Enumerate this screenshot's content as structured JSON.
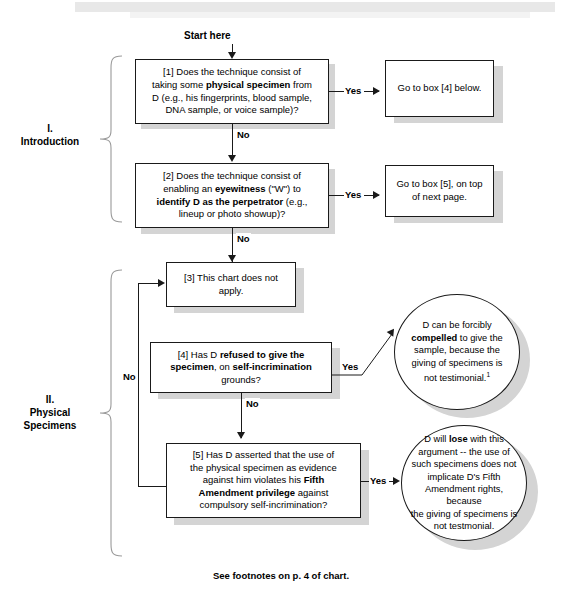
{
  "chart_title": "Self-Incrimination / Physical Specimens Flowchart",
  "start": {
    "label": "Start here"
  },
  "sections": [
    {
      "roman": "I.",
      "name": "Introduction"
    },
    {
      "roman": "II.",
      "name": "Physical",
      "name2": "Specimens"
    }
  ],
  "edge_labels": {
    "yes": "Yes",
    "no": "No"
  },
  "boxes": {
    "b1": {
      "id": "[1]",
      "text_plain": "[1] Does the technique consist of taking some physical specimen from D (e.g., his fingerprints, blood sample, DNA sample, or voice sample)?",
      "line1": "[1] Does the technique consist of",
      "line2a": "taking some ",
      "line2b": "physical specimen",
      "line2c": " from",
      "line3": "D (e.g., his fingerprints, blood sample,",
      "line4": "DNA sample, or voice sample)?"
    },
    "b1_yes": {
      "text_plain": "Go to box [4] below.",
      "line1": "Go to box [4] below."
    },
    "b2": {
      "id": "[2]",
      "text_plain": "[2] Does the technique consist of enabling an eyewitness (\"W\") to identify D as the perpetrator (e.g., lineup or photo showup)?",
      "line1": "[2] Does the technique consist of",
      "line2a": "enabling an ",
      "line2b": "eyewitness",
      "line2c": " (\"W\") to",
      "line3a": "identify D as the perpetrator",
      "line3b": " (e.g.,",
      "line4": "lineup or photo showup)?"
    },
    "b2_yes": {
      "text_plain": "Go to box [5], on top of next page.",
      "line1": "Go to box [5], on top",
      "line2": "of next page."
    },
    "b3": {
      "id": "[3]",
      "text_plain": "[3] This chart does not apply.",
      "line1": "[3] This chart does not",
      "line2": "apply."
    },
    "b4": {
      "id": "[4]",
      "text_plain": "[4] Has D refused to give the specimen, on self-incrimination grounds?",
      "line1a": "[4] Has D ",
      "line1b": "refused to give the",
      "line2a": "specimen",
      "line2b": ", on ",
      "line2c": "self-incrimination",
      "line3": "grounds?"
    },
    "b5": {
      "id": "[5]",
      "text_plain": "[5] Has D asserted that the use of the physical specimen as evidence against him violates his Fifth Amendment privilege against compulsory self-incrimination?",
      "line1": "[5] Has D asserted that the use of",
      "line2": "the physical specimen as evidence",
      "line3a": "against him violates his ",
      "line3b": "Fifth",
      "line4a": "Amendment privilege",
      "line4b": " against",
      "line5": "compulsory self-incrimination?"
    }
  },
  "ellipses": {
    "e4": {
      "text_plain": "D can be forcibly compelled to give the sample, because the giving of specimens is not testimonial. 1",
      "line1": "D can be forcibly",
      "line2a": "compelled",
      "line2b": " to give the",
      "line3": "sample, because the",
      "line4": "giving of specimens is",
      "line5": "not testimonial.",
      "footnote_marker": "1"
    },
    "e5": {
      "text_plain": "D will lose with this argument -- the use of such specimens does not implicate D's Fifth Amendment rights, because the giving of specimens is not testmonial.",
      "line1a": "D will ",
      "line1b": "lose",
      "line1c": " with this",
      "line2": "argument -- the use of",
      "line3": "such specimens does not",
      "line4": "implicate D's Fifth",
      "line5": "Amendment rights, because",
      "line6": "the giving of specimens is",
      "line7": "not testmonial."
    }
  },
  "footer": {
    "text": "See footnotes on p. 4 of chart."
  },
  "colors": {
    "line": "#1a1a1a",
    "shadow": "#d4d4d4",
    "background": "#ffffff",
    "text": "#000000"
  }
}
